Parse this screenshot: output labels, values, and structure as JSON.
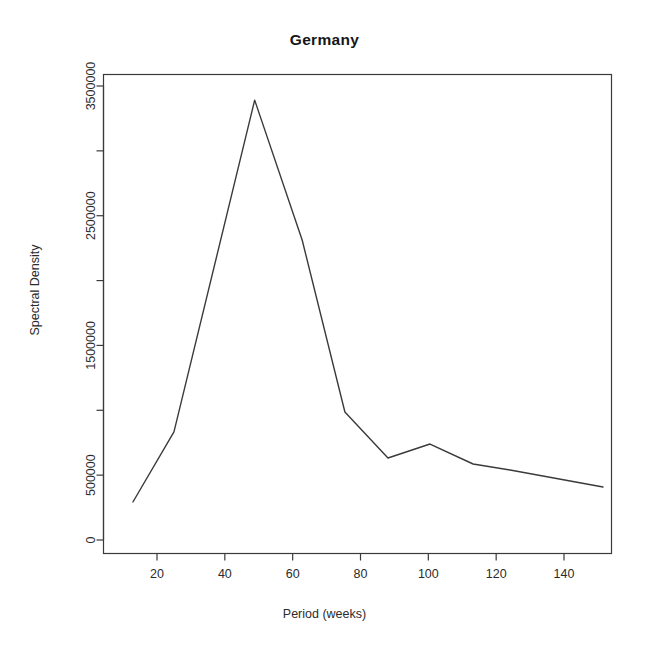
{
  "chart_data": {
    "type": "line",
    "title": "Germany",
    "xlabel": "Period (weeks)",
    "ylabel": "Spectral Density",
    "grid": false,
    "legend": null,
    "xlim": [
      11,
      157
    ],
    "ylim": [
      0,
      3600000
    ],
    "xticks": [
      20,
      40,
      60,
      80,
      100,
      120,
      140
    ],
    "xtick_labels": [
      "20",
      "40",
      "60",
      "80",
      "100",
      "120",
      "140"
    ],
    "yticks": [
      0,
      500000,
      1000000,
      1500000,
      2000000,
      2500000,
      3000000,
      3500000
    ],
    "ytick_labels": [
      "0",
      "500000",
      "",
      "1500000",
      "",
      "2500000",
      "",
      "3500000"
    ],
    "series": [
      {
        "name": "Spectral Density",
        "color": "#3a3a3a",
        "x": [
          12.9,
          25.0,
          48.8,
          62.8,
          75.4,
          88.1,
          100.5,
          113.2,
          124.1,
          151.5
        ],
        "y": [
          293000,
          833000,
          3391000,
          2313000,
          987000,
          632000,
          740000,
          586000,
          540000,
          409000
        ]
      }
    ]
  },
  "figure": {
    "title": "Germany",
    "axis_x_label": "Period (weeks)",
    "axis_y_label": "Spectral Density"
  }
}
